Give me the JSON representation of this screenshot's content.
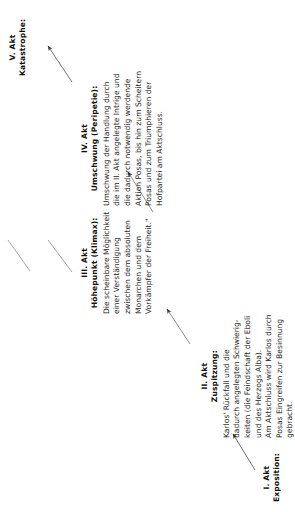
{
  "diagram": {
    "type": "freytag-pyramid",
    "line_color": "#6e6e6e",
    "text_color": "#1a1a1a",
    "background": "#ffffff"
  },
  "acts": [
    {
      "id": "act-1",
      "act_label": "I. Akt",
      "title": "Exposition:",
      "body": []
    },
    {
      "id": "act-2",
      "act_label": "II. Akt",
      "title": "Zuspitzung:",
      "body": [
        "Karlos' Rückfall und die",
        "dadurch angelegten Schwierig-",
        "keiten (die Feindschaft der Eboli",
        "und des Herzogs Alba).",
        "Am Aktschluss wird Karlos durch",
        "Posas Eingreifen zur Besinnung",
        "gebracht."
      ]
    },
    {
      "id": "act-3",
      "act_label": "III. Akt",
      "title": "Höhepunkt (Klimax):",
      "body": [
        "Die scheinbare Möglichkeit",
        "einer Verständigung",
        "zwischen dem absoluten",
        "Monarchen und dem",
        "Vorkämpfer der Freiheit.\""
      ]
    },
    {
      "id": "act-4",
      "act_label": "IV. Akt",
      "title": "Umschwung (Peripetie):",
      "body": [
        "Umschwung der Handlung durch",
        "die im II. Akt angelegte Intrige und",
        "die dadurch notwendig werdende",
        "Aktion Posas, bis hin zum Scheitern",
        "Posas und zum Triumphieren der",
        "Hofpartei am Aktschluss."
      ]
    },
    {
      "id": "act-5",
      "act_label": "V. Akt",
      "title": "Katastrophe:",
      "body": []
    }
  ],
  "connectors": [
    {
      "id": "arrow-1-to-2",
      "from": "I. Akt",
      "to": "II. Akt",
      "style": "arrow"
    },
    {
      "id": "arrow-2-to-3",
      "from": "II. Akt",
      "to": "III. Akt",
      "style": "arrow"
    },
    {
      "id": "rise-line-left",
      "from": "III. Akt",
      "to": "apex",
      "style": "line"
    },
    {
      "id": "fall-line-right",
      "from": "apex",
      "to": "IV. Akt",
      "style": "line"
    },
    {
      "id": "arrow-3-to-4",
      "from": "III. Akt",
      "to": "IV. Akt",
      "style": "arrow"
    },
    {
      "id": "arrow-4-to-5",
      "from": "IV. Akt",
      "to": "V. Akt",
      "style": "arrow"
    }
  ]
}
